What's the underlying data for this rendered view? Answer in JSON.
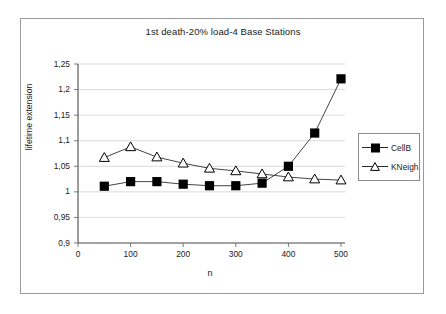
{
  "chart_data": {
    "type": "line",
    "title": "1st death-20% load-4 Base Stations",
    "xlabel": "n",
    "ylabel": "lifetime extension",
    "x": [
      50,
      100,
      150,
      200,
      250,
      300,
      350,
      400,
      450,
      500
    ],
    "xlim": [
      0,
      500
    ],
    "ylim": [
      0.9,
      1.25
    ],
    "xticks": [
      "0",
      "100",
      "200",
      "300",
      "400",
      "500"
    ],
    "xtick_values": [
      0,
      100,
      200,
      300,
      400,
      500
    ],
    "yticks": [
      "0,9",
      "0,95",
      "1",
      "1,05",
      "1,1",
      "1,15",
      "1,2",
      "1,25"
    ],
    "ytick_values": [
      0.9,
      0.95,
      1.0,
      1.05,
      1.1,
      1.15,
      1.2,
      1.25
    ],
    "grid": "horizontal",
    "legend_position": "right",
    "series": [
      {
        "name": "CellB",
        "marker": "filled-square",
        "color": "#000000",
        "values": [
          1.011,
          1.02,
          1.02,
          1.015,
          1.012,
          1.012,
          1.017,
          1.05,
          1.115,
          1.221
        ]
      },
      {
        "name": "KNeigh",
        "marker": "open-triangle",
        "color": "#000000",
        "values": [
          1.067,
          1.088,
          1.068,
          1.056,
          1.046,
          1.041,
          1.035,
          1.029,
          1.025,
          1.023
        ]
      }
    ]
  },
  "legend": {
    "items": [
      {
        "label": "CellB"
      },
      {
        "label": "KNeigh"
      }
    ]
  },
  "axis": {
    "x_title": "n",
    "y_title": "lifetime extension"
  }
}
